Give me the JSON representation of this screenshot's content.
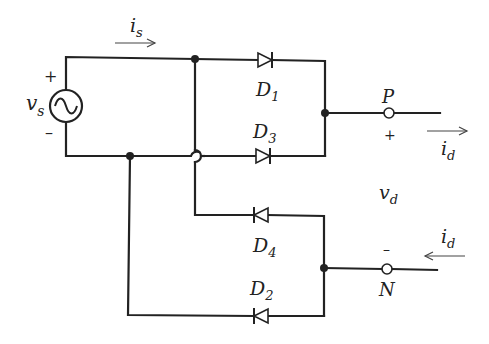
{
  "source": {
    "name": "v",
    "sub": "s",
    "plus": "+",
    "minus": "–",
    "symbol": "ac-source"
  },
  "source_current": {
    "name": "i",
    "sub": "s"
  },
  "diodes": [
    {
      "id": "D1",
      "name": "D",
      "sub": "1"
    },
    {
      "id": "D3",
      "name": "D",
      "sub": "3"
    },
    {
      "id": "D4",
      "name": "D",
      "sub": "4"
    },
    {
      "id": "D2",
      "name": "D",
      "sub": "2"
    }
  ],
  "terminals": {
    "P": {
      "label": "P",
      "sign": "+"
    },
    "N": {
      "label": "N",
      "sign": "–"
    }
  },
  "output_voltage": {
    "name": "v",
    "sub": "d"
  },
  "output_current_top": {
    "name": "i",
    "sub": "d"
  },
  "output_current_bottom": {
    "name": "i",
    "sub": "d"
  },
  "colors": {
    "wire": "#222222",
    "background": "#ffffff"
  }
}
